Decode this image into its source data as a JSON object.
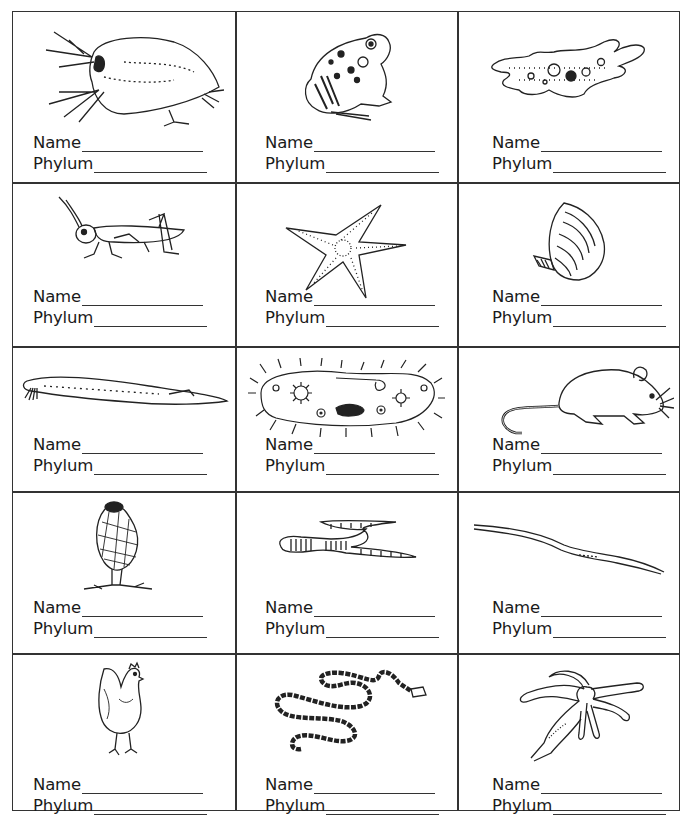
{
  "worksheet": {
    "labels": {
      "name": "Name",
      "phylum": "Phylum"
    },
    "cells": [
      {
        "organism": "daphnia (water flea)",
        "icon": "daphnia-icon",
        "name_value": "",
        "phylum_value": ""
      },
      {
        "organism": "frog",
        "icon": "frog-icon",
        "name_value": "",
        "phylum_value": ""
      },
      {
        "organism": "amoeba",
        "icon": "amoeba-icon",
        "name_value": "",
        "phylum_value": ""
      },
      {
        "organism": "grasshopper",
        "icon": "grasshopper-icon",
        "name_value": "",
        "phylum_value": ""
      },
      {
        "organism": "starfish",
        "icon": "starfish-icon",
        "name_value": "",
        "phylum_value": ""
      },
      {
        "organism": "clam",
        "icon": "clam-icon",
        "name_value": "",
        "phylum_value": ""
      },
      {
        "organism": "lancelet",
        "icon": "lancelet-icon",
        "name_value": "",
        "phylum_value": ""
      },
      {
        "organism": "paramecium",
        "icon": "paramecium-icon",
        "name_value": "",
        "phylum_value": ""
      },
      {
        "organism": "mouse",
        "icon": "mouse-icon",
        "name_value": "",
        "phylum_value": ""
      },
      {
        "organism": "sponge",
        "icon": "sponge-icon",
        "name_value": "",
        "phylum_value": ""
      },
      {
        "organism": "earthworm",
        "icon": "earthworm-icon",
        "name_value": "",
        "phylum_value": ""
      },
      {
        "organism": "roundworm",
        "icon": "roundworm-icon",
        "name_value": "",
        "phylum_value": ""
      },
      {
        "organism": "chicken",
        "icon": "chicken-icon",
        "name_value": "",
        "phylum_value": ""
      },
      {
        "organism": "tapeworm",
        "icon": "tapeworm-icon",
        "name_value": "",
        "phylum_value": ""
      },
      {
        "organism": "hydra",
        "icon": "hydra-icon",
        "name_value": "",
        "phylum_value": ""
      }
    ]
  }
}
